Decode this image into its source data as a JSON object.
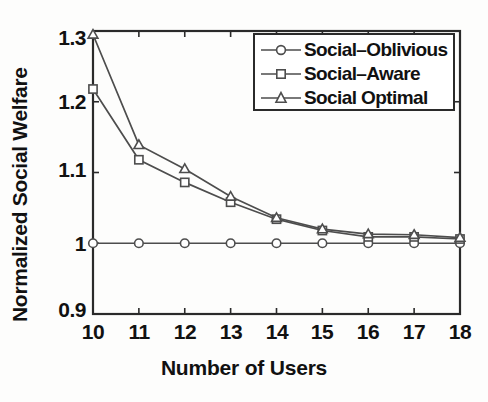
{
  "chart_data": {
    "type": "line",
    "title": "",
    "subtitle": "",
    "xlabel": "Number of Users",
    "ylabel": "Normalized Social Welfare",
    "x": [
      10,
      11,
      12,
      13,
      14,
      15,
      16,
      17,
      18
    ],
    "categories": [
      "10",
      "11",
      "12",
      "13",
      "14",
      "15",
      "16",
      "17",
      "18"
    ],
    "xlim": [
      10,
      18
    ],
    "ylim": [
      0.9,
      1.3
    ],
    "xticks": [
      "10",
      "11",
      "12",
      "13",
      "14",
      "15",
      "16",
      "17",
      "18"
    ],
    "yticks": [
      "0.9",
      "1",
      "1.1",
      "1.2",
      "1.3"
    ],
    "ytick_values": [
      0.9,
      1.0,
      1.1,
      1.2,
      1.3
    ],
    "grid": false,
    "legend_position": "top-right",
    "series": [
      {
        "name": "Social-Oblivious",
        "marker": "circle",
        "color": "#4d4d4d",
        "values": [
          1.0,
          1.0,
          1.0,
          1.0,
          1.0,
          1.0,
          1.0,
          1.0,
          1.0
        ]
      },
      {
        "name": "Social-Aware",
        "marker": "square",
        "color": "#4d4d4d",
        "values": [
          1.218,
          1.118,
          1.086,
          1.058,
          1.034,
          1.018,
          1.009,
          1.009,
          1.006
        ]
      },
      {
        "name": "Social Optimal",
        "marker": "triangle",
        "color": "#4d4d4d",
        "values": [
          1.295,
          1.139,
          1.105,
          1.066,
          1.036,
          1.02,
          1.013,
          1.012,
          1.008
        ]
      }
    ]
  },
  "legend": {
    "items": [
      {
        "label": "Social–Oblivious",
        "marker": "circle-marker-icon"
      },
      {
        "label": "Social–Aware",
        "marker": "square-marker-icon"
      },
      {
        "label": "Social Optimal",
        "marker": "triangle-marker-icon"
      }
    ]
  },
  "axes": {
    "x_title": "Number of Users",
    "y_title": "Normalized Social Welfare",
    "x_tick_labels": [
      "10",
      "11",
      "12",
      "13",
      "14",
      "15",
      "16",
      "17",
      "18"
    ],
    "y_tick_labels": [
      "1.3",
      "1.2",
      "1.1",
      "1",
      "0.9"
    ]
  },
  "style": {
    "axis_color": "#2a2a2a",
    "line_color": "#4d4d4d",
    "background": "#fdfdfc",
    "text_color": "#111111"
  }
}
